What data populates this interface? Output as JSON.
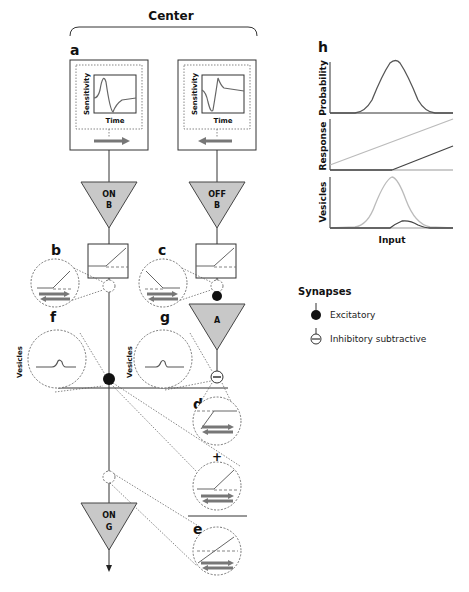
{
  "header": {
    "title": "Center"
  },
  "panels": {
    "a": {
      "label": "a",
      "kernel_ylabel": "Sensitivity",
      "kernel_xlabel": "Time"
    },
    "b": {
      "label": "b"
    },
    "c": {
      "label": "c"
    },
    "d": {
      "label": "d"
    },
    "e": {
      "label": "e"
    },
    "f": {
      "label": "f",
      "ylabel": "Vesicles"
    },
    "g": {
      "label": "g",
      "ylabel": "Vesicles"
    },
    "h": {
      "label": "h",
      "xlabel": "Input",
      "plots": [
        "Probability",
        "Response",
        "Vesicles"
      ]
    }
  },
  "cells": {
    "on_bipolar": {
      "line1": "ON",
      "line2": "B"
    },
    "off_bipolar": {
      "line1": "OFF",
      "line2": "B"
    },
    "amacrine": {
      "line1": "A"
    },
    "on_ganglion": {
      "line1": "ON",
      "line2": "G"
    }
  },
  "plus_sign": "+",
  "legend": {
    "title": "Synapses",
    "items": [
      {
        "icon": "excitatory-synapse-icon",
        "label": "Excitatory"
      },
      {
        "icon": "inhibitory-synapse-icon",
        "label": "Inhibitory subtractive"
      }
    ]
  },
  "colors": {
    "triangle_fill": "#c8c8c8",
    "curve_dark": "#555555",
    "curve_light": "#bbbbbb",
    "arrow": "#777777"
  }
}
